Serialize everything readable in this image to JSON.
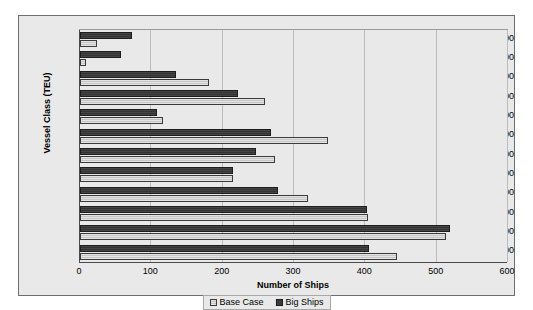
{
  "chart_data": {
    "type": "bar",
    "orientation": "horizontal",
    "title": "",
    "xlabel": "Number of Ships",
    "ylabel": "Vessel Class (TEU)",
    "xlim": [
      0,
      600
    ],
    "xticks": [
      "0",
      "100",
      "200",
      "300",
      "400",
      "500",
      "600"
    ],
    "grid": true,
    "legend_position": "bottom",
    "categories": [
      "12,000",
      "10,000",
      "8,000",
      "6,000",
      "5,000",
      "4,000",
      "3,000",
      "2,500",
      "2,000",
      "1,500",
      "1,000",
      "500"
    ],
    "series": [
      {
        "name": "Base Case",
        "color": "#d4d4d4",
        "values": [
          24,
          9,
          181,
          260,
          117,
          348,
          274,
          214,
          320,
          404,
          513,
          445
        ]
      },
      {
        "name": "Big Ships",
        "color": "#3c3c3c",
        "values": [
          73,
          58,
          135,
          222,
          108,
          268,
          247,
          215,
          278,
          403,
          518,
          405
        ]
      }
    ]
  },
  "legend": {
    "items": [
      {
        "label": "Base Case",
        "swatch": "base"
      },
      {
        "label": "Big Ships",
        "swatch": "big"
      }
    ]
  }
}
